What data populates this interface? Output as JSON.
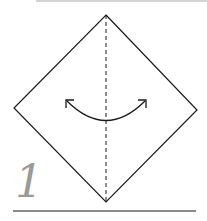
{
  "diagram": {
    "step_number": "1",
    "shape": "square-paper-diamond",
    "fold_line": "valley-fold-vertical-center",
    "arrow": "fold-and-unfold",
    "colors": {
      "line": "#1a1a1a",
      "step_number": "#9a9a9a",
      "bottom_rule": "#8a8a8a",
      "top_rule": "#d4d4d4"
    }
  }
}
